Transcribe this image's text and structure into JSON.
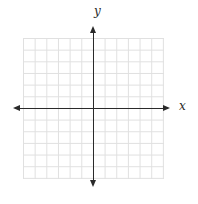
{
  "chart": {
    "x_axis_label": "x",
    "y_axis_label": "y"
  },
  "colors": {
    "axis": "#2a2a2a",
    "grid": "#e0e0e0",
    "background": "#ffffff"
  },
  "chart_data": {
    "type": "scatter",
    "title": "",
    "xlabel": "x",
    "ylabel": "y",
    "xlim": [
      -6,
      6
    ],
    "ylim": [
      -6,
      6
    ],
    "grid": true,
    "grid_cells": [
      12,
      12
    ],
    "axis_arrows": [
      "left",
      "right",
      "up",
      "down"
    ],
    "series": []
  }
}
